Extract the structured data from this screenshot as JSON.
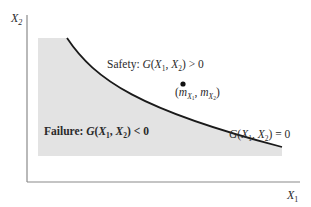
{
  "diagram": {
    "type": "limit-state-diagram",
    "axes": {
      "x_label": {
        "base": "X",
        "sub": "1"
      },
      "y_label": {
        "base": "X",
        "sub": "2"
      }
    },
    "regions": {
      "safety": {
        "prefix": "Safety: ",
        "func": "G",
        "args_open": "(",
        "arg1": "X",
        "arg1_sub": "1",
        "sep": ", ",
        "arg2": "X",
        "arg2_sub": "2",
        "args_close": ")",
        "relation": " > 0"
      },
      "failure": {
        "prefix": "Failure: ",
        "func": "G",
        "args_open": "(",
        "arg1": "X",
        "arg1_sub": "1",
        "sep": ", ",
        "arg2": "X",
        "arg2_sub": "2",
        "args_close": ")",
        "relation": " < 0"
      }
    },
    "limit_state_curve": {
      "func": "G",
      "args_open": "(",
      "arg1": "X",
      "arg1_sub": "1",
      "sep": ", ",
      "arg2": "X",
      "arg2_sub": "2",
      "args_close": ")",
      "relation": " = 0"
    },
    "mean_point": {
      "open": "(",
      "m": "m",
      "sub1": "X",
      "subsub1": "1",
      "sep": ", ",
      "sub2": "X",
      "subsub2": "2",
      "close": ")"
    },
    "colors": {
      "failure_fill": "#e3e3e3",
      "curve": "#1a1a1a",
      "axis": "#8a8a8a"
    }
  }
}
